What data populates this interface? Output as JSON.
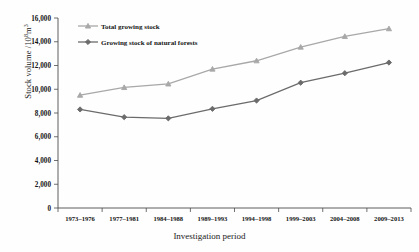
{
  "chart_data": {
    "type": "line",
    "title": "",
    "xlabel": "Investigation period",
    "ylabel": "Stock volume /10⁸m³",
    "ylabel_prefix": "Stock volume /10",
    "ylabel_exponent": "8",
    "ylabel_suffix": "m",
    "ylabel_unit_exponent": "3",
    "categories": [
      "1973–1976",
      "1977–1981",
      "1984–1988",
      "1989–1993",
      "1994–1998",
      "1999–2003",
      "2004–2008",
      "2009–2013"
    ],
    "series": [
      {
        "name": "Total growing stock",
        "color": "#a8a8a8",
        "marker": "triangle",
        "values": [
          9500,
          10150,
          10450,
          11700,
          12400,
          13550,
          14450,
          15100
        ]
      },
      {
        "name": "Growing stock of natural forests",
        "color": "#6b6b6b",
        "marker": "diamond",
        "values": [
          8300,
          7650,
          7550,
          8350,
          9050,
          10550,
          11350,
          12250
        ]
      }
    ],
    "ylim": [
      0,
      16000
    ],
    "yticks": [
      0,
      2000,
      4000,
      6000,
      8000,
      10000,
      12000,
      14000,
      16000
    ],
    "ytick_labels": [
      "0",
      "2,000",
      "4,000",
      "6,000",
      "8,000",
      "10,000",
      "12,000",
      "14,000",
      "16,000"
    ],
    "grid": false,
    "legend_position": "top-left",
    "axis_color": "#4d4d4d",
    "background_color": "#fefefe"
  }
}
